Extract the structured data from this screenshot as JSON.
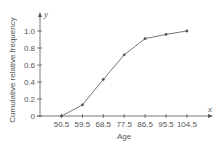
{
  "chart_data": {
    "type": "line",
    "title": "",
    "xlabel": "Age",
    "ylabel": "Cumulative relative frequency",
    "x_axis_var": "x",
    "y_axis_var": "y",
    "x": [
      50.5,
      59.5,
      68.5,
      77.5,
      86.5,
      95.5,
      104.5
    ],
    "categories": [
      "50.5",
      "59.5",
      "68.5",
      "77.5",
      "86.5",
      "95.5",
      "104.5"
    ],
    "series": [
      {
        "name": "Cumulative relative frequency",
        "values": [
          0,
          0.13,
          0.43,
          0.72,
          0.91,
          0.96,
          1.0
        ]
      }
    ],
    "y_ticks": [
      "0",
      "0.2",
      "0.4",
      "0.6",
      "0.8",
      "1.0"
    ],
    "ylim": [
      0,
      1.0
    ],
    "grid": false,
    "legend": null,
    "colors": {
      "line": "#777777",
      "marker": "#555555",
      "axis": "#555555",
      "text": "#555555"
    }
  }
}
